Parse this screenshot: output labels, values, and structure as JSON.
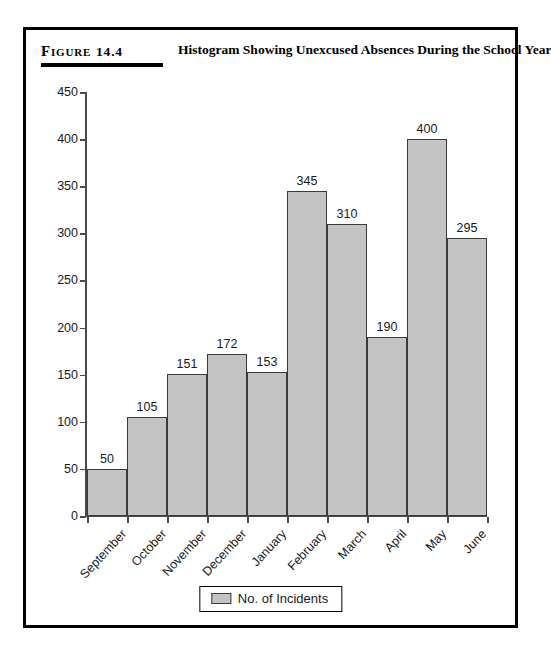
{
  "figure": {
    "label_word": "Figure",
    "number": "14.4",
    "title": "Histogram Showing Unexcused Absences During the School Year"
  },
  "legend": {
    "entries": [
      {
        "label": "No. of Incidents",
        "color": "#c4c4c4"
      }
    ]
  },
  "chart_data": {
    "type": "bar",
    "title": "Histogram Showing Unexcused Absences During the School Year",
    "xlabel": "",
    "ylabel": "",
    "categories": [
      "September",
      "October",
      "November",
      "December",
      "January",
      "February",
      "March",
      "April",
      "May",
      "June"
    ],
    "values": [
      50,
      105,
      151,
      172,
      153,
      345,
      310,
      190,
      400,
      295
    ],
    "series": [
      {
        "name": "No. of Incidents",
        "values": [
          50,
          105,
          151,
          172,
          153,
          345,
          310,
          190,
          400,
          295
        ]
      }
    ],
    "ylim": [
      0,
      450
    ],
    "ytick_labels": [
      "0",
      "50",
      "100",
      "150",
      "200",
      "250",
      "300",
      "350",
      "400",
      "450"
    ],
    "ytick_values": [
      0,
      50,
      100,
      150,
      200,
      250,
      300,
      350,
      400,
      450
    ],
    "grid": false,
    "legend_position": "bottom-center",
    "bar_color": "#c4c4c4",
    "bar_edge_color": "#3a3a3a",
    "bar_gap": 0,
    "data_labels_shown": true
  }
}
